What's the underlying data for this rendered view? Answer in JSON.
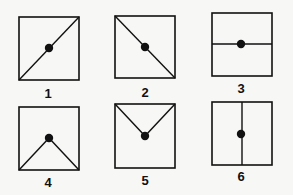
{
  "figure": {
    "panels": [
      {
        "label": "1",
        "box": [
          19,
          17,
          60,
          63
        ],
        "lines": [
          [
            19,
            80,
            79,
            17
          ]
        ],
        "dot": [
          49,
          48
        ]
      },
      {
        "label": "2",
        "box": [
          115,
          16,
          60,
          62
        ],
        "lines": [
          [
            115,
            16,
            175,
            78
          ]
        ],
        "dot": [
          145,
          47
        ]
      },
      {
        "label": "3",
        "box": [
          212,
          13,
          60,
          63
        ],
        "lines": [
          [
            212,
            44,
            272,
            44
          ]
        ],
        "dot": [
          241,
          44
        ]
      },
      {
        "label": "4",
        "box": [
          19,
          107,
          60,
          63
        ],
        "lines": [
          [
            19,
            170,
            49,
            138
          ],
          [
            49,
            138,
            79,
            170
          ]
        ],
        "dot": [
          49,
          138
        ]
      },
      {
        "label": "5",
        "box": [
          115,
          104,
          60,
          64
        ],
        "lines": [
          [
            115,
            104,
            145,
            136
          ],
          [
            145,
            136,
            175,
            104
          ]
        ],
        "dot": [
          145,
          136
        ]
      },
      {
        "label": "6",
        "box": [
          212,
          102,
          60,
          63
        ],
        "lines": [
          [
            242,
            102,
            242,
            165
          ]
        ],
        "dot": [
          241,
          134
        ]
      }
    ],
    "label_positions": [
      [
        48,
        98
      ],
      [
        145,
        97
      ],
      [
        241,
        93
      ],
      [
        48,
        187
      ],
      [
        145,
        185
      ],
      [
        241,
        181
      ]
    ],
    "colors": {
      "stroke": "#111111",
      "background": "#f7f7f5"
    }
  }
}
